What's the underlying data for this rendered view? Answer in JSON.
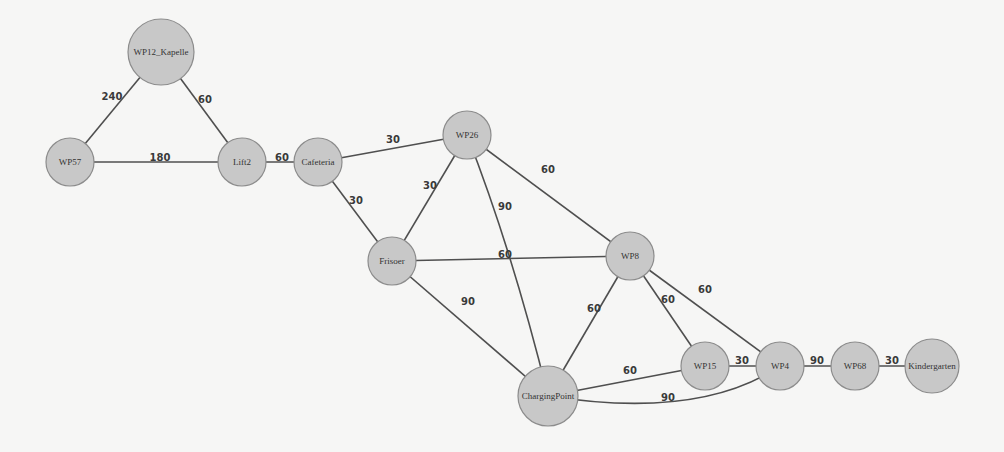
{
  "diagram": {
    "type": "weighted-undirected-graph",
    "colors": {
      "background": "#f6f6f5",
      "node_fill": "#c8c8c8",
      "node_stroke": "#8c8c8c",
      "edge": "#4f4f4f",
      "label": "#333333"
    },
    "nodes": [
      {
        "id": "WP12_Kapelle",
        "label": "WP12_Kapelle",
        "x": 161,
        "y": 52,
        "r": 33
      },
      {
        "id": "WP57",
        "label": "WP57",
        "x": 70,
        "y": 162,
        "r": 24
      },
      {
        "id": "Lift2",
        "label": "Lift2",
        "x": 242,
        "y": 162,
        "r": 24
      },
      {
        "id": "Cafeteria",
        "label": "Cafeteria",
        "x": 318,
        "y": 162,
        "r": 24
      },
      {
        "id": "WP26",
        "label": "WP26",
        "x": 467,
        "y": 135,
        "r": 24
      },
      {
        "id": "Frisoer",
        "label": "Frisoer",
        "x": 392,
        "y": 261,
        "r": 24
      },
      {
        "id": "WP8",
        "label": "WP8",
        "x": 630,
        "y": 256,
        "r": 24
      },
      {
        "id": "ChargingPoint",
        "label": "ChargingPoint",
        "x": 548,
        "y": 396,
        "r": 30
      },
      {
        "id": "WP15",
        "label": "WP15",
        "x": 705,
        "y": 366,
        "r": 24
      },
      {
        "id": "WP4",
        "label": "WP4",
        "x": 780,
        "y": 366,
        "r": 24
      },
      {
        "id": "WP68",
        "label": "WP68",
        "x": 855,
        "y": 366,
        "r": 24
      },
      {
        "id": "Kindergarten",
        "label": "Kindergarten",
        "x": 932,
        "y": 366,
        "r": 27
      }
    ],
    "edges": [
      {
        "from": "WP57",
        "to": "WP12_Kapelle",
        "weight": "240",
        "lx": 112,
        "ly": 96
      },
      {
        "from": "WP12_Kapelle",
        "to": "Lift2",
        "weight": "60",
        "lx": 205,
        "ly": 99
      },
      {
        "from": "WP57",
        "to": "Lift2",
        "weight": "180",
        "lx": 160,
        "ly": 157
      },
      {
        "from": "Lift2",
        "to": "Cafeteria",
        "weight": "60",
        "lx": 282,
        "ly": 157
      },
      {
        "from": "Cafeteria",
        "to": "WP26",
        "weight": "30",
        "lx": 393,
        "ly": 139
      },
      {
        "from": "Cafeteria",
        "to": "Frisoer",
        "weight": "30",
        "lx": 356,
        "ly": 200
      },
      {
        "from": "Frisoer",
        "to": "WP26",
        "weight": "30",
        "lx": 430,
        "ly": 185
      },
      {
        "from": "WP26",
        "to": "WP8",
        "weight": "60",
        "lx": 548,
        "ly": 169
      },
      {
        "from": "WP26",
        "to": "ChargingPoint",
        "weight": "90",
        "lx": 505,
        "ly": 206,
        "curve": [
          512,
          250
        ]
      },
      {
        "from": "Frisoer",
        "to": "WP8",
        "weight": "60",
        "lx": 505,
        "ly": 254
      },
      {
        "from": "Frisoer",
        "to": "ChargingPoint",
        "weight": "90",
        "lx": 468,
        "ly": 301
      },
      {
        "from": "WP8",
        "to": "ChargingPoint",
        "weight": "60",
        "lx": 594,
        "ly": 308
      },
      {
        "from": "WP8",
        "to": "WP15",
        "weight": "60",
        "lx": 668,
        "ly": 299
      },
      {
        "from": "WP8",
        "to": "WP4",
        "weight": "60",
        "lx": 705,
        "ly": 289
      },
      {
        "from": "ChargingPoint",
        "to": "WP15",
        "weight": "60",
        "lx": 630,
        "ly": 370
      },
      {
        "from": "ChargingPoint",
        "to": "WP4",
        "weight": "90",
        "lx": 668,
        "ly": 397,
        "curve": [
          700,
          420
        ]
      },
      {
        "from": "WP15",
        "to": "WP4",
        "weight": "30",
        "lx": 742,
        "ly": 360
      },
      {
        "from": "WP4",
        "to": "WP68",
        "weight": "90",
        "lx": 817,
        "ly": 360
      },
      {
        "from": "WP68",
        "to": "Kindergarten",
        "weight": "30",
        "lx": 892,
        "ly": 360
      }
    ]
  }
}
